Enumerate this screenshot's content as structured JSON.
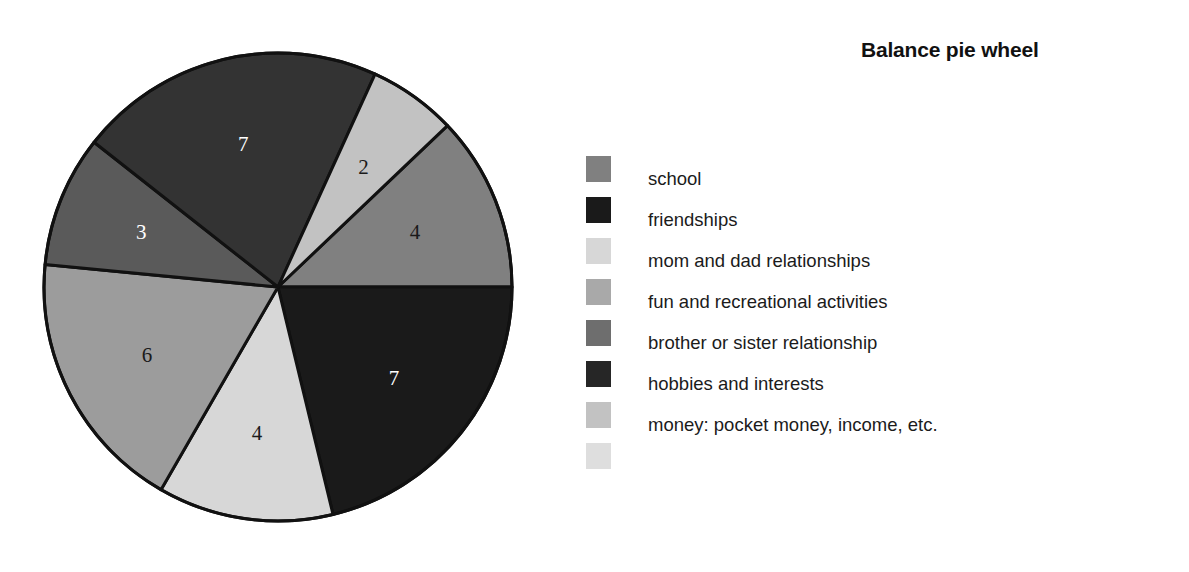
{
  "chart_data": {
    "type": "pie",
    "title": "Balance pie wheel",
    "xlabel": "",
    "ylabel": "",
    "legend_position": "right",
    "grid": false,
    "total": 33,
    "categories": [
      "school",
      "friendships",
      "mom and dad relationships",
      "fun and recreational activities",
      "brother or sister relationship",
      "hobbies and interests",
      "money: pocket money, income, etc."
    ],
    "values": [
      4,
      7,
      4,
      6,
      3,
      7,
      2
    ],
    "colors": [
      "#808080",
      "#1a1a1a",
      "#d7d7d7",
      "#9c9c9c",
      "#5a5a5a",
      "#333333",
      "#c2c2c2"
    ],
    "slices": [
      {
        "label": "school",
        "value": 4,
        "value_text": "4",
        "color": "#808080",
        "start_angle": -43.6,
        "end_angle": 0.0,
        "label_color": "#1a1a1a"
      },
      {
        "label": "friendships",
        "value": 7,
        "value_text": "7",
        "color": "#1a1a1a",
        "start_angle": 0.0,
        "end_angle": 76.4,
        "label_color": "#ffffff"
      },
      {
        "label": "mom and dad relationships",
        "value": 4,
        "value_text": "4",
        "color": "#d7d7d7",
        "start_angle": 76.4,
        "end_angle": 120.0,
        "label_color": "#1a1a1a"
      },
      {
        "label": "fun and recreational activities",
        "value": 6,
        "value_text": "6",
        "color": "#9c9c9c",
        "start_angle": 120.0,
        "end_angle": 185.5,
        "label_color": "#1a1a1a"
      },
      {
        "label": "brother or sister relationship",
        "value": 3,
        "value_text": "3",
        "color": "#5a5a5a",
        "start_angle": 185.5,
        "end_angle": 218.2,
        "label_color": "#ffffff"
      },
      {
        "label": "hobbies and interests",
        "value": 7,
        "value_text": "7",
        "color": "#333333",
        "start_angle": 218.2,
        "end_angle": 294.5,
        "label_color": "#ffffff"
      },
      {
        "label": "money: pocket money, income, etc.",
        "value": 2,
        "value_text": "2",
        "color": "#c2c2c2",
        "start_angle": 294.5,
        "end_angle": 316.4,
        "label_color": "#1a1a1a"
      }
    ],
    "geometry": {
      "center_x": 248,
      "center_y": 259,
      "radius": 234,
      "label_radius_fraction": 0.63,
      "outline_color": "#111111",
      "outline_width": 3
    }
  },
  "legend": {
    "entries": [
      {
        "label": "school",
        "color": "#808080"
      },
      {
        "label": "friendships",
        "color": "#1a1a1a"
      },
      {
        "label": "mom and dad relationships",
        "color": "#d7d7d7"
      },
      {
        "label": "fun and recreational activities",
        "color": "#a9a9a9"
      },
      {
        "label": "brother or sister relationship",
        "color": "#6e6e6e"
      },
      {
        "label": "hobbies and interests",
        "color": "#262626"
      },
      {
        "label": "money: pocket money, income, etc.",
        "color": "#c2c2c2"
      },
      {
        "label": "",
        "color": "#dedede"
      }
    ]
  }
}
